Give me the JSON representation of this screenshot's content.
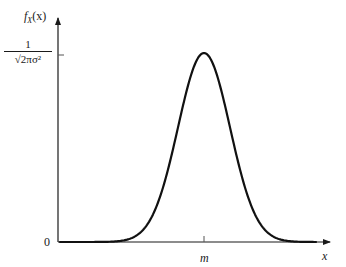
{
  "chart_data": {
    "type": "line",
    "title": "",
    "xlabel": "x",
    "ylabel": "f_X(x)",
    "series": [
      {
        "name": "Gaussian PDF",
        "mean": "m",
        "description": "Normal (Gaussian) probability density function centered at m with peak value 1/sqrt(2*pi*sigma^2)",
        "x_rel_to_m_in_sigma": [
          -4,
          -3,
          -2.5,
          -2,
          -1.5,
          -1,
          -0.5,
          0,
          0.5,
          1,
          1.5,
          2,
          2.5,
          3,
          4
        ],
        "y_rel_to_peak": [
          0.0003,
          0.011,
          0.044,
          0.135,
          0.325,
          0.607,
          0.882,
          1.0,
          0.882,
          0.607,
          0.325,
          0.135,
          0.044,
          0.011,
          0.0003
        ]
      }
    ],
    "x_ticks": [
      {
        "label": "m",
        "position": "mean"
      }
    ],
    "y_ticks": [
      {
        "label": "0",
        "position": "origin"
      },
      {
        "label": "1/√(2πσ²)",
        "position": "peak"
      }
    ],
    "grid": false,
    "legend": "none"
  },
  "labels": {
    "y_axis": "f",
    "y_axis_sub": "X",
    "y_axis_arg": "(x)",
    "x_axis": "x",
    "origin": "0",
    "mean_tick": "m",
    "peak_numerator": "1",
    "peak_denominator": "√2πσ²"
  }
}
